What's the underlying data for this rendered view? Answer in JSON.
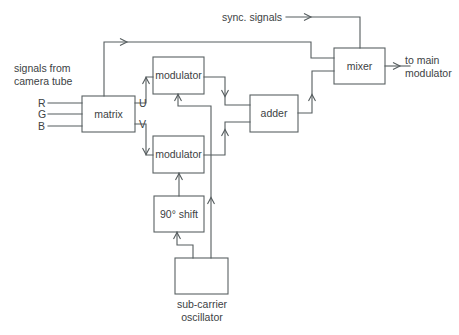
{
  "diagram": {
    "stroke_color": "#555c5e",
    "text_color": "#3c4244",
    "background": "#ffffff",
    "blocks": [
      {
        "id": "matrix",
        "label": "matrix",
        "x": 82,
        "y": 96,
        "w": 53,
        "h": 36
      },
      {
        "id": "modulator_u",
        "label": "modulator",
        "x": 153,
        "y": 57,
        "w": 51,
        "h": 37
      },
      {
        "id": "modulator_v",
        "label": "modulator",
        "x": 153,
        "y": 136,
        "w": 51,
        "h": 37
      },
      {
        "id": "adder",
        "label": "adder",
        "x": 250,
        "y": 95,
        "w": 48,
        "h": 37
      },
      {
        "id": "mixer",
        "label": "mixer",
        "x": 334,
        "y": 48,
        "w": 51,
        "h": 36
      },
      {
        "id": "shift",
        "label": "90° shift",
        "x": 154,
        "y": 196,
        "w": 50,
        "h": 36
      },
      {
        "id": "oscillator",
        "label": "",
        "x": 175,
        "y": 258,
        "w": 53,
        "h": 36
      }
    ],
    "labels": {
      "source_caption_line1": "signals from",
      "source_caption_line2": "camera tube",
      "input_r": "R",
      "input_g": "G",
      "input_b": "B",
      "signal_u": "U",
      "signal_v": "V",
      "sync_signals": "sync. signals",
      "output_line1": "to main",
      "output_line2": "modulator",
      "oscillator_line1": "sub-carrier",
      "oscillator_line2": "oscillator",
      "shift_label": "90° shift",
      "matrix_label": "matrix",
      "adder_label": "adder",
      "mixer_label": "mixer",
      "modulator_label": "modulator"
    }
  }
}
